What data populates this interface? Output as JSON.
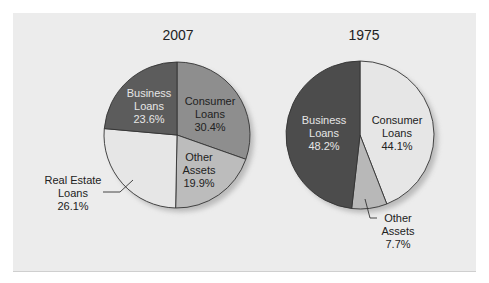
{
  "chart_data": [
    {
      "type": "pie",
      "title": "2007",
      "start_angle": "12 o'clock, clockwise",
      "slices": [
        {
          "label": "Consumer Loans",
          "value": 30.4,
          "display": "30.4%",
          "color": "#8e8e8e"
        },
        {
          "label": "Other Assets",
          "value": 19.9,
          "display": "19.9%",
          "color": "#bcbcbc"
        },
        {
          "label": "Real Estate Loans",
          "value": 26.1,
          "display": "26.1%",
          "color": "#e6e6e6"
        },
        {
          "label": "Business Loans",
          "value": 23.6,
          "display": "23.6%",
          "color": "#5c5c5c"
        }
      ]
    },
    {
      "type": "pie",
      "title": "1975",
      "start_angle": "12 o'clock, clockwise",
      "slices": [
        {
          "label": "Consumer Loans",
          "value": 44.1,
          "display": "44.1%",
          "color": "#e6e6e6"
        },
        {
          "label": "Other Assets",
          "value": 7.7,
          "display": "7.7%",
          "color": "#b8b8b8"
        },
        {
          "label": "Business Loans",
          "value": 48.2,
          "display": "48.2%",
          "color": "#4c4c4c"
        }
      ]
    }
  ],
  "labels": {
    "left": {
      "business": [
        "Business",
        "Loans",
        "23.6%"
      ],
      "consumer": [
        "Consumer",
        "Loans",
        "30.4%"
      ],
      "other": [
        "Other",
        "Assets",
        "19.9%"
      ],
      "realestate": [
        "Real Estate",
        "Loans",
        "26.1%"
      ]
    },
    "right": {
      "business": [
        "Business",
        "Loans",
        "48.2%"
      ],
      "consumer": [
        "Consumer",
        "Loans",
        "44.1%"
      ],
      "other": [
        "Other",
        "Assets",
        "7.7%"
      ]
    }
  }
}
